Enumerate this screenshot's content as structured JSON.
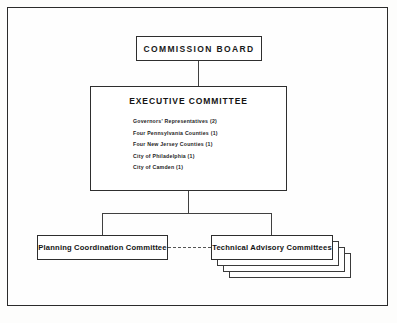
{
  "diagram": {
    "nodes": {
      "commission_board": {
        "label": "COMMISSION BOARD"
      },
      "executive_committee": {
        "label": "EXECUTIVE COMMITTEE",
        "members": [
          "Governors' Representatives (2)",
          "Four Pennsylvania Counties (1)",
          "Four New Jersey Counties (1)",
          "City of Philadelphia (1)",
          "City of Camden (1)"
        ]
      },
      "planning_coordination_committee": {
        "label": "Planning Coordination Committee"
      },
      "technical_advisory_committees": {
        "label": "Technical Advisory Committees",
        "stack_count": 4
      }
    },
    "colors": {
      "line": "#2e2e2e",
      "frame": "#2b2b2b",
      "text": "#141414",
      "background": "#fefefe",
      "dashed_link": "#555555"
    }
  }
}
